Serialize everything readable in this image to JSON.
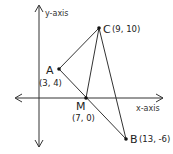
{
  "diagram": {
    "axes": {
      "x_label": "x-axis",
      "y_label": "y-axis"
    },
    "points": {
      "A": {
        "name": "A",
        "coord": "(3, 4)"
      },
      "B": {
        "name": "B",
        "coord": "(13, -6)"
      },
      "C": {
        "name": "C",
        "coord": "(9, 10)"
      },
      "M": {
        "name": "M",
        "coord": "(7, 0)"
      }
    },
    "segments": [
      "AC",
      "CB",
      "AB",
      "CM"
    ],
    "colors": {
      "line": "#333333",
      "point": "#111111",
      "background": "#ffffff"
    }
  }
}
